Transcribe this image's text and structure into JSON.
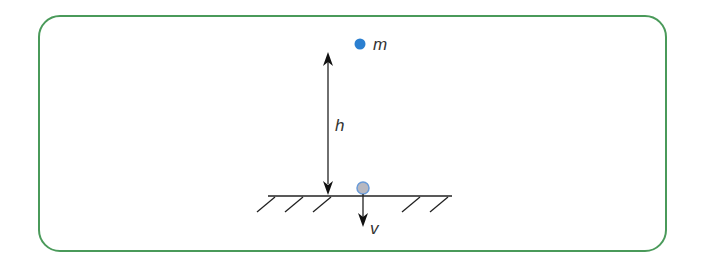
{
  "diagram": {
    "border_color": "#4a9a5a",
    "labels": {
      "mass": "m",
      "height": "h",
      "velocity": "v"
    },
    "elements": {
      "mass_point": {
        "color": "#2b7fd0",
        "description": "mass m at height h"
      },
      "ball_at_ground": {
        "fill": "#b8b8c0",
        "stroke": "#6a9bd8",
        "description": "ball reaching ground"
      },
      "height_arrow": {
        "description": "double-headed arrow indicating height h"
      },
      "velocity_arrow": {
        "description": "downward arrow indicating velocity v"
      },
      "ground": {
        "description": "hatched ground line"
      }
    }
  }
}
